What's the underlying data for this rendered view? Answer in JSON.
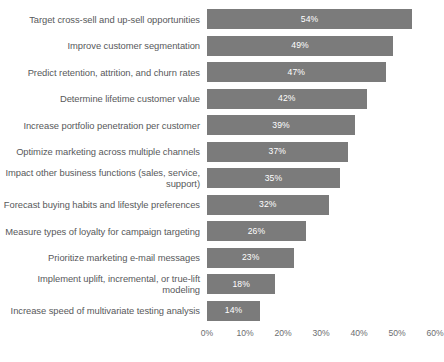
{
  "chart_data": {
    "type": "bar",
    "orientation": "horizontal",
    "title": "",
    "xlabel": "",
    "ylabel": "",
    "xlim": [
      0,
      60
    ],
    "grid": false,
    "legend": false,
    "value_suffix": "%",
    "bar_color": "#7b7b7b",
    "value_label_color": "#ffffff",
    "category_label_color": "#58595b",
    "axis_ticks": [
      "0%",
      "10%",
      "20%",
      "30%",
      "40%",
      "50%",
      "60%"
    ],
    "axis_tick_values": [
      0,
      10,
      20,
      30,
      40,
      50,
      60
    ],
    "categories": [
      "Target cross-sell and up-sell opportunities",
      "Improve customer segmentation",
      "Predict retention, attrition, and churn rates",
      "Determine lifetime customer value",
      "Increase portfolio penetration per customer",
      "Optimize marketing across multiple channels",
      "Impact other business functions (sales, service, support)",
      "Forecast buying habits and lifestyle preferences",
      "Measure types of loyalty for campaign targeting",
      "Prioritize marketing e-mail messages",
      "Implement uplift, incremental, or true-lift modeling",
      "Increase speed of multivariate testing analysis"
    ],
    "values": [
      54,
      49,
      47,
      42,
      39,
      37,
      35,
      32,
      26,
      23,
      18,
      14
    ],
    "value_labels": [
      "54%",
      "49%",
      "47%",
      "42%",
      "39%",
      "37%",
      "35%",
      "32%",
      "26%",
      "23%",
      "18%",
      "14%"
    ]
  }
}
